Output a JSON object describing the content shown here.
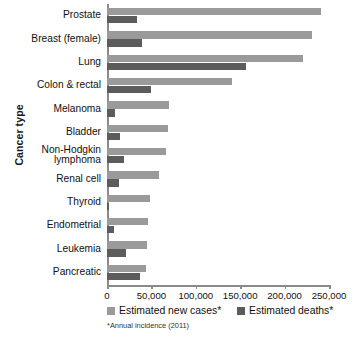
{
  "chart_data": {
    "type": "bar",
    "orientation": "horizontal",
    "title": "",
    "xlabel": "",
    "ylabel": "Cancer type",
    "xlim": [
      0,
      250000
    ],
    "xticks": [
      0,
      50000,
      100000,
      150000,
      200000,
      250000
    ],
    "xtick_labels": [
      "0",
      "50,000",
      "100,000",
      "150,000",
      "200,000",
      "250,000"
    ],
    "grid": false,
    "legend_position": "bottom",
    "categories": [
      "Prostate",
      "Breast (female)",
      "Lung",
      "Colon & rectal",
      "Melanoma",
      "Bladder",
      "Non-Hodgkin lymphoma",
      "Renal cell",
      "Thyroid",
      "Endometrial",
      "Leukemia",
      "Pancreatic"
    ],
    "series": [
      {
        "name": "Estimated new cases*",
        "color": "#9a9a9a",
        "values": [
          240890,
          230480,
          221130,
          141210,
          70230,
          69250,
          66360,
          58240,
          48020,
          46470,
          44600,
          44030
        ]
      },
      {
        "name": "Estimated deaths*",
        "color": "#5c5c5c",
        "values": [
          33720,
          39520,
          156940,
          49380,
          8790,
          14990,
          19320,
          13040,
          1740,
          8120,
          21780,
          37660
        ]
      }
    ],
    "footnote": "*Annual incidence (2011)"
  },
  "axis": {
    "y_title": "Cancer type"
  },
  "legend": {
    "items": [
      {
        "label": "Estimated new cases*",
        "swatch": "cases"
      },
      {
        "label": "Estimated deaths*",
        "swatch": "deaths"
      }
    ]
  },
  "footnote": "*Annual incidence (2011)",
  "colors": {
    "cases": "#9a9a9a",
    "deaths": "#5c5c5c",
    "axis": "#8a8a8a"
  }
}
